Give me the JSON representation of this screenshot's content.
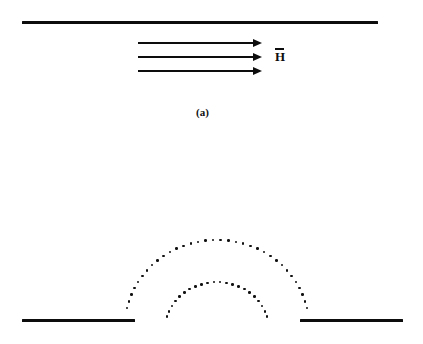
{
  "figure": {
    "background_color": "#ffffff",
    "ink_color": "#0d0d0d",
    "width": 423,
    "height": 344
  },
  "panel_a": {
    "caption": "(a)",
    "caption_x": 196,
    "caption_y": 106,
    "plate": {
      "x": 22,
      "y": 21,
      "width": 356,
      "height": 3.2
    },
    "field_label": {
      "text": "H",
      "x": 275,
      "y": 48,
      "has_vector_bar": true
    },
    "arrows": {
      "x_start": 138,
      "x_end": 262,
      "rows_y": [
        42,
        56,
        70
      ]
    }
  },
  "panel_b": {
    "caption": "",
    "left_plate": {
      "x": 22,
      "y": 319,
      "width": 113,
      "height": 3.2
    },
    "right_plate": {
      "x": 300,
      "y": 319,
      "width": 103,
      "height": 3.2
    },
    "gap": {
      "x_left": 135,
      "x_right": 300,
      "center_x": 217
    },
    "fringing_arcs": [
      {
        "name": "outer-fringing-arc",
        "center_x": 217,
        "center_y": 326,
        "radius_x": 92,
        "radius_y": 86,
        "dot_count": 34,
        "start_angle_deg": 192,
        "end_angle_deg": 348,
        "dot_size": 2.6
      },
      {
        "name": "inner-fringing-arc",
        "center_x": 217,
        "center_y": 330,
        "radius_x": 52,
        "radius_y": 48,
        "dot_count": 22,
        "start_angle_deg": 196,
        "end_angle_deg": 344,
        "dot_size": 2.6
      }
    ]
  }
}
